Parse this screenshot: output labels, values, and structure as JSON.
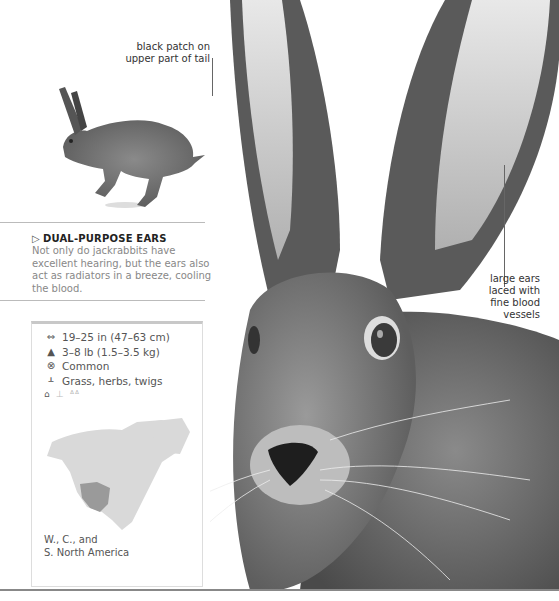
{
  "callouts": {
    "tail": "black patch on upper part of tail",
    "tail_lines": [
      "black patch on",
      "upper part of tail"
    ],
    "ears_lines": [
      "large ears",
      "laced with",
      "fine blood",
      "vessels"
    ]
  },
  "section": {
    "marker": "▷",
    "heading": "DUAL-PURPOSE EARS",
    "body": "Not only do jackrabbits have excellent hearing, but the ears also act as radiators in a breeze, cooling the blood."
  },
  "factbox": {
    "facts": [
      {
        "icon": "length-icon",
        "glyph": "⇔",
        "text": "19–25 in (47–63 cm)"
      },
      {
        "icon": "weight-icon",
        "glyph": "▲",
        "text": "3–8 lb (1.5–3.5 kg)"
      },
      {
        "icon": "status-icon",
        "glyph": "⊗",
        "text": "Common"
      },
      {
        "icon": "diet-icon",
        "glyph": "ᚆ",
        "text": "Grass, herbs, twigs"
      }
    ],
    "habitat_icons": [
      "home-icon",
      "desert-plant-icon",
      "grassland-icon"
    ],
    "range_lines": [
      "W., C., and",
      "S. North America"
    ]
  },
  "colors": {
    "text": "#333333",
    "muted": "#888888",
    "map_land": "#d9d9d9",
    "map_range": "#9a9a9a"
  }
}
